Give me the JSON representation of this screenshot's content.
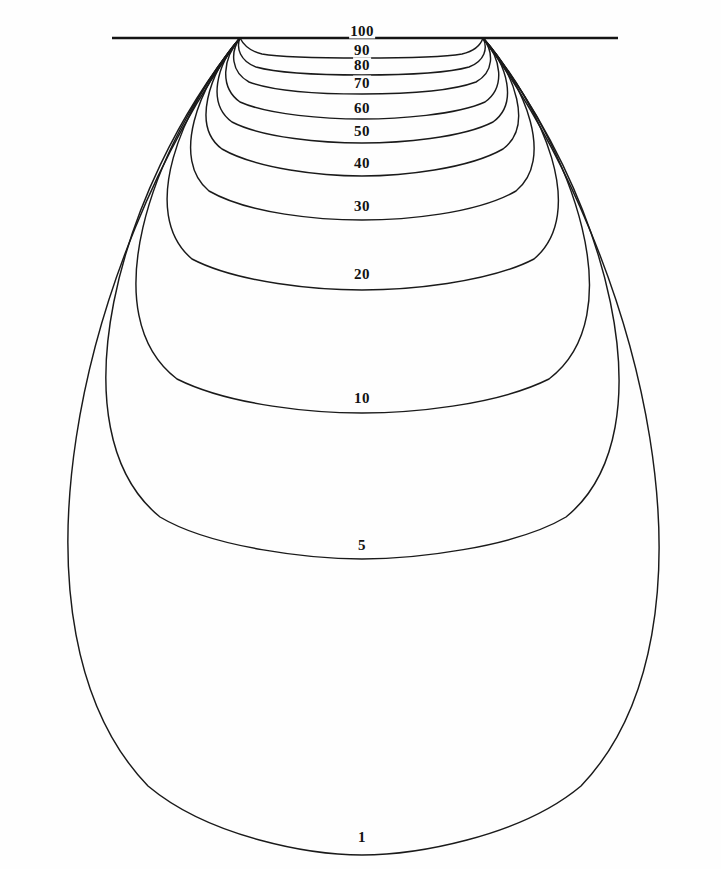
{
  "figure": {
    "title": "",
    "background_color": "#fefefe",
    "line_color": "#1a1a1a",
    "width": 721,
    "height": 869
  },
  "surface": {
    "name": "ground-surface-line",
    "x1": 112,
    "x2": 618,
    "y": 38
  },
  "singularities": [
    {
      "name": "left-source",
      "x": 240,
      "y": 38
    },
    {
      "name": "right-source",
      "x": 483,
      "y": 38
    }
  ],
  "chart_data": {
    "type": "line",
    "subtype": "contour",
    "title": "",
    "xlabel": "",
    "ylabel": "",
    "grid": false,
    "legend": "none",
    "axis_visible": false,
    "levels": [
      100,
      90,
      80,
      70,
      60,
      50,
      40,
      30,
      20,
      10,
      5,
      1
    ],
    "level_labels": [
      "100",
      "90",
      "80",
      "70",
      "60",
      "50",
      "40",
      "30",
      "20",
      "10",
      "5",
      "1"
    ],
    "contours": [
      {
        "level": 100,
        "label": "100",
        "label_x": 362,
        "label_y": 31,
        "label_size": 15,
        "bottom_y": 38,
        "half_width": 0,
        "flat_x1": 240,
        "flat_x2": 483,
        "path": "M 112 38 L 618 38"
      },
      {
        "level": 90,
        "label": "90",
        "label_x": 362,
        "label_y": 50,
        "label_size": 15,
        "bottom_y": 57,
        "flat_x1": 300,
        "flat_x2": 425,
        "path": "M 240 38 C 243 44 249 51 262 54 C 285 58 330 58 362 58 C 394 58 439 58 462 54 C 475 51 481 44 483 38"
      },
      {
        "level": 80,
        "label": "80",
        "label_x": 362,
        "label_y": 65,
        "label_size": 15,
        "bottom_y": 73,
        "flat_x1": 295,
        "flat_x2": 430,
        "path": "M 240 38 C 236 48 240 61 256 67 C 281 74 330 75 362 75 C 394 75 444 74 469 67 C 485 61 488 48 483 38"
      },
      {
        "level": 70,
        "label": "70",
        "label_x": 362,
        "label_y": 83,
        "label_size": 15,
        "bottom_y": 92,
        "flat_x1": 290,
        "flat_x2": 435,
        "path": "M 240 38 C 230 52 231 72 249 82 C 276 92 328 94 362 94 C 396 94 449 92 476 82 C 494 72 494 52 483 38"
      },
      {
        "level": 60,
        "label": "60",
        "label_x": 362,
        "label_y": 108,
        "label_size": 15,
        "bottom_y": 118,
        "flat_x1": 285,
        "flat_x2": 440,
        "path": "M 240 38 C 223 58 219 87 240 102 C 269 115 326 119 362 119 C 398 119 456 115 485 102 C 506 87 501 58 483 38"
      },
      {
        "level": 50,
        "label": "50",
        "label_x": 362,
        "label_y": 131,
        "label_size": 15,
        "bottom_y": 142,
        "flat_x1": 280,
        "flat_x2": 445,
        "path": "M 240 38 C 216 65 207 104 232 122 C 263 138 324 143 362 143 C 400 143 462 138 493 122 C 518 104 508 65 483 38"
      },
      {
        "level": 40,
        "label": "40",
        "label_x": 362,
        "label_y": 163,
        "label_size": 15,
        "bottom_y": 175,
        "flat_x1": 275,
        "flat_x2": 450,
        "path": "M 240 38 C 208 74 192 127 222 149 C 257 169 322 176 362 176 C 402 176 468 169 503 149 C 533 127 516 74 483 38"
      },
      {
        "level": 30,
        "label": "30",
        "label_x": 362,
        "label_y": 206,
        "label_size": 15,
        "bottom_y": 219,
        "flat_x1": 270,
        "flat_x2": 455,
        "path": "M 240 38 C 197 87 171 160 209 191 C 249 214 320 220 362 220 C 404 220 476 214 516 191 C 554 160 527 87 483 38"
      },
      {
        "level": 20,
        "label": "20",
        "label_x": 362,
        "label_y": 274,
        "label_size": 15,
        "bottom_y": 289,
        "flat_x1": 292,
        "flat_x2": 455,
        "path": "M 240 38 C 180 109 138 213 192 259 C 238 283 318 290 362 290 C 406 290 488 283 534 259 C 588 213 544 109 483 38"
      },
      {
        "level": 10,
        "label": "10",
        "label_x": 362,
        "label_y": 398,
        "label_size": 15,
        "bottom_y": 412,
        "flat_x1": 290,
        "flat_x2": 452,
        "path": "M 240 38 C 148 152 94 316 177 379 C 231 406 316 413 362 413 C 408 413 495 406 549 379 C 632 316 576 152 483 38"
      },
      {
        "level": 5,
        "label": "5",
        "label_x": 362,
        "label_y": 545,
        "label_size": 15,
        "bottom_y": 558,
        "flat_x1": 265,
        "flat_x2": 470,
        "path": "M 240 38 C 116 190 54 431 160 517 C 212 548 312 559 362 559 C 412 559 514 548 566 517 C 672 431 606 190 483 38"
      },
      {
        "level": 1,
        "label": "1",
        "label_x": 362,
        "label_y": 837,
        "label_size": 15,
        "bottom_y": 854,
        "flat_x1": 252,
        "flat_x2": 458,
        "path": "M 240 38 C 76 262 -2 630 148 786 C 210 838 312 855 362 855 C 412 855 519 838 581 786 C 730 630 648 262 483 38"
      }
    ]
  }
}
